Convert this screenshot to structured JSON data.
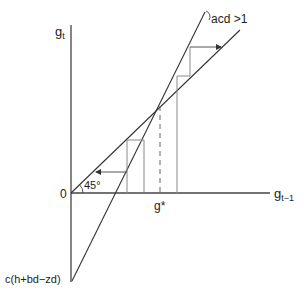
{
  "diagram": {
    "y_axis_label": "g",
    "y_axis_sub": "t",
    "x_axis_label": "g",
    "x_axis_sub": "t−1",
    "origin_label": "0",
    "angle_label": "45°",
    "equilibrium_label": "g*",
    "intercept_label": "c(h+bd−zd)",
    "condition_label": "acd >1",
    "colors": {
      "line": "#333333",
      "guide": "#777777",
      "background": "#ffffff"
    }
  }
}
